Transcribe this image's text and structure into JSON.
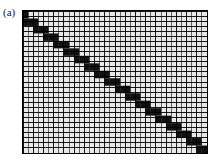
{
  "figure": {
    "panel_label": "(a)",
    "caption_alt": "",
    "type": "matrix-sparsity-pattern"
  },
  "colors": {
    "background": "#ffffff",
    "grid_fill": "#e8e8e8",
    "grid_line": "#2b2b2b",
    "grid_line_major": "#000000",
    "block_fill": "#111111",
    "frame": "#000000"
  },
  "chart_data": {
    "type": "heatmap",
    "title": "",
    "subtitle": "",
    "xlabel": "",
    "ylabel": "",
    "xlim": [
      0,
      36
    ],
    "ylim": [
      0,
      28
    ],
    "grid": true,
    "legend": false,
    "legend_position": "none",
    "xticklabels": [],
    "yticklabels": [],
    "annotations": [],
    "n_cols": 36,
    "n_rows": 28,
    "cell_width": 5.1667,
    "cell_height": 5.1429,
    "value_filled": 1,
    "value_empty": 0,
    "blocks": [
      {
        "col": 0,
        "row": 0,
        "w": 1,
        "h": 2
      },
      {
        "col": 0,
        "row": 2,
        "w": 3,
        "h": 2
      },
      {
        "col": 2,
        "row": 4,
        "w": 3,
        "h": 2
      },
      {
        "col": 4,
        "row": 6,
        "w": 3,
        "h": 2
      },
      {
        "col": 6,
        "row": 8,
        "w": 3,
        "h": 2
      },
      {
        "col": 8,
        "row": 10,
        "w": 3,
        "h": 2
      },
      {
        "col": 10,
        "row": 12,
        "w": 3,
        "h": 2
      },
      {
        "col": 12,
        "row": 14,
        "w": 3,
        "h": 2
      },
      {
        "col": 14,
        "row": 16,
        "w": 3,
        "h": 2
      },
      {
        "col": 16,
        "row": 18,
        "w": 3,
        "h": 2
      },
      {
        "col": 18,
        "row": 20,
        "w": 3,
        "h": 2
      },
      {
        "col": 20,
        "row": 22,
        "w": 3,
        "h": 2
      },
      {
        "col": 22,
        "row": 24,
        "w": 3,
        "h": 2
      },
      {
        "col": 24,
        "row": 26,
        "w": 3,
        "h": 2
      },
      {
        "col": 26,
        "row": 28,
        "w": 3,
        "h": 2
      },
      {
        "col": 28,
        "row": 30,
        "w": 3,
        "h": 2
      },
      {
        "col": 30,
        "row": 32,
        "w": 3,
        "h": 2
      },
      {
        "col": 32,
        "row": 34,
        "w": 3,
        "h": 2
      },
      {
        "col": 34,
        "row": 36,
        "w": 2,
        "h": 2
      }
    ]
  }
}
